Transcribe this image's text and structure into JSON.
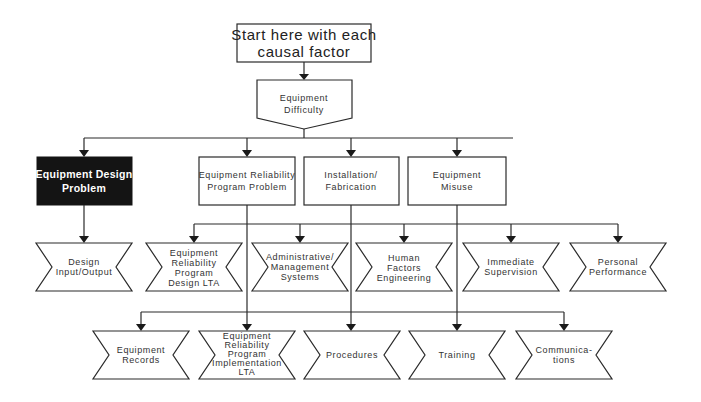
{
  "diagram": {
    "start": {
      "lines": [
        "Start here with each",
        "causal factor"
      ]
    },
    "category": {
      "lines": [
        "Equipment",
        "Difficulty"
      ]
    },
    "problems": [
      {
        "id": "equipment-design-problem",
        "lines": [
          "Equipment Design",
          "Problem"
        ],
        "highlighted": true
      },
      {
        "id": "equipment-reliability-program-problem",
        "lines": [
          "Equipment Reliability",
          "Program Problem"
        ],
        "highlighted": false
      },
      {
        "id": "installation-fabrication",
        "lines": [
          "Installation/",
          "Fabrication"
        ],
        "highlighted": false
      },
      {
        "id": "equipment-misuse",
        "lines": [
          "Equipment",
          "Misuse"
        ],
        "highlighted": false
      }
    ],
    "row1": [
      {
        "id": "design-input-output",
        "lines": [
          "Design",
          "Input/Output"
        ]
      },
      {
        "id": "equipment-reliability-program-design-lta",
        "lines": [
          "Equipment",
          "Reliability",
          "Program",
          "Design  LTA"
        ]
      },
      {
        "id": "administrative-management-systems",
        "lines": [
          "Administrative/",
          "Management",
          "Systems"
        ]
      },
      {
        "id": "human-factors-engineering",
        "lines": [
          "Human",
          "Factors",
          "Engineering"
        ]
      },
      {
        "id": "immediate-supervision",
        "lines": [
          "Immediate",
          "Supervision"
        ]
      },
      {
        "id": "personal-performance",
        "lines": [
          "Personal",
          "Performance"
        ]
      }
    ],
    "row2": [
      {
        "id": "equipment-records",
        "lines": [
          "Equipment",
          "Records"
        ]
      },
      {
        "id": "equipment-reliability-program-implementation-lta",
        "lines": [
          "Equipment",
          "Reliability",
          "Program",
          "Implementation",
          "LTA"
        ]
      },
      {
        "id": "procedures",
        "lines": [
          "Procedures"
        ]
      },
      {
        "id": "training",
        "lines": [
          "Training"
        ]
      },
      {
        "id": "communications",
        "lines": [
          "Communica-",
          "tions"
        ]
      }
    ],
    "colors": {
      "line": "#2a2a2a",
      "highlight_fill": "#141414",
      "highlight_text": "#ffffff",
      "text": "#333333"
    }
  }
}
